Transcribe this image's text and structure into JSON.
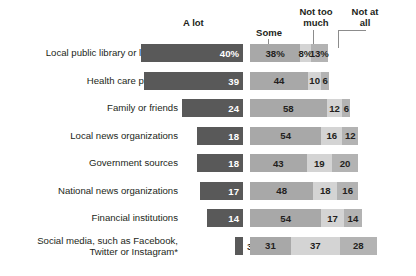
{
  "chart_data": {
    "type": "bar",
    "subtype": "stacked-horizontal-with-leading-column",
    "title": "",
    "xlabel": "",
    "ylabel": "",
    "grid": false,
    "legend_position": "top",
    "columns": [
      "A lot",
      "Some",
      "Not too much",
      "Not at all"
    ],
    "categories": [
      "Local public library or librarians",
      "Health care providers",
      "Family or friends",
      "Local news organizations",
      "Government sources",
      "National news organizations",
      "Financial institutions",
      "Social media, such as Facebook,\nTwitter or Instagram*"
    ],
    "series": [
      {
        "name": "A lot",
        "values": [
          40,
          39,
          24,
          18,
          18,
          17,
          14,
          3
        ]
      },
      {
        "name": "Some",
        "values": [
          38,
          44,
          58,
          54,
          43,
          48,
          54,
          31
        ]
      },
      {
        "name": "Not too much",
        "values": [
          8,
          10,
          12,
          16,
          19,
          18,
          17,
          37
        ]
      },
      {
        "name": "Not at all",
        "values": [
          13,
          6,
          6,
          12,
          20,
          16,
          14,
          28
        ]
      }
    ],
    "value_labels": {
      "a_lot": [
        "40%",
        "39",
        "24",
        "18",
        "18",
        "17",
        "14",
        "3"
      ],
      "some": [
        "38%",
        "44",
        "58",
        "54",
        "43",
        "48",
        "54",
        "31"
      ],
      "not_too_much": [
        "8%",
        "10",
        "12",
        "16",
        "19",
        "18",
        "17",
        "37"
      ],
      "not_at_all": [
        "13%",
        "6",
        "6",
        "12",
        "16",
        "16",
        "14",
        "28"
      ]
    },
    "colors": {
      "a_lot": "#595959",
      "some": "#a8a8a8",
      "not_too_much": "#d4d4d4",
      "not_at_all": "#b3b3b3",
      "text": "#231f20",
      "background": "#ffffff"
    }
  },
  "header": {
    "a_lot": "A lot",
    "some": "Some",
    "not_too_much": "Not too\nmuch",
    "not_at_all": "Not at\nall"
  },
  "rows": [
    {
      "label": "Local public library or librarians",
      "a_lot": "40%",
      "some": "38%",
      "not_too_much": "8%",
      "not_at_all": "13%"
    },
    {
      "label": "Health care providers",
      "a_lot": "39",
      "some": "44",
      "not_too_much": "10",
      "not_at_all": "6"
    },
    {
      "label": "Family or friends",
      "a_lot": "24",
      "some": "58",
      "not_too_much": "12",
      "not_at_all": "6"
    },
    {
      "label": "Local news organizations",
      "a_lot": "18",
      "some": "54",
      "not_too_much": "16",
      "not_at_all": "12"
    },
    {
      "label": "Government sources",
      "a_lot": "18",
      "some": "43",
      "not_too_much": "19",
      "not_at_all": "20"
    },
    {
      "label": "National news organizations",
      "a_lot": "17",
      "some": "48",
      "not_too_much": "18",
      "not_at_all": "16"
    },
    {
      "label": "Financial institutions",
      "a_lot": "14",
      "some": "54",
      "not_too_much": "17",
      "not_at_all": "14"
    },
    {
      "label": "Social media, such as Facebook,\nTwitter or Instagram*",
      "a_lot": "3",
      "some": "31",
      "not_too_much": "37",
      "not_at_all": "28"
    }
  ]
}
